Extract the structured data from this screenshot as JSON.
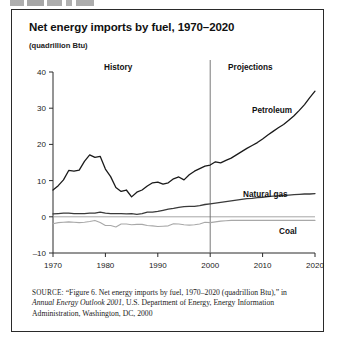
{
  "figure": {
    "top_fragment": "",
    "title": "Net energy imports by fuel, 1970–2020",
    "axis_unit": "(quadrillion Btu)",
    "region_labels": {
      "history": "History",
      "projections": "Projections"
    },
    "series_labels": {
      "petroleum": "Petroleum",
      "natural_gas": "Natural gas",
      "coal": "Coal"
    },
    "source": {
      "prefix": "SOURCE:",
      "part1": " “Figure 6. Net energy imports by fuel, 1970–2020 (quadrillion Btu),” in ",
      "italic": "Annual Energy Outlook 2001",
      "part2": ", U.S. Department of Energy, Energy Information Administration, Washington, DC, 2000"
    }
  },
  "chart_data": {
    "type": "line",
    "title": "Net energy imports by fuel, 1970–2020",
    "xlabel": "",
    "ylabel": "(quadrillion Btu)",
    "xlim": [
      1970,
      2020
    ],
    "ylim": [
      -10,
      40
    ],
    "yticks": [
      -10,
      0,
      10,
      20,
      30,
      40
    ],
    "xticks": [
      1970,
      1980,
      1990,
      2000,
      2010,
      2020
    ],
    "grid": false,
    "legend_position": "inline-right-of-series",
    "annotations": [
      {
        "text": "History",
        "x": 1980,
        "y": 37
      },
      {
        "text": "Projections",
        "x": 2010,
        "y": 37
      },
      {
        "text": "Petroleum",
        "x": 2012,
        "y": 26
      },
      {
        "text": "Natural gas",
        "x": 2011,
        "y": 8
      },
      {
        "text": "Coal",
        "x": 2018,
        "y": -3
      }
    ],
    "history_projection_divider": 2000,
    "x": [
      1970,
      1971,
      1972,
      1973,
      1974,
      1975,
      1976,
      1977,
      1978,
      1979,
      1980,
      1981,
      1982,
      1983,
      1984,
      1985,
      1986,
      1987,
      1988,
      1989,
      1990,
      1991,
      1992,
      1993,
      1994,
      1995,
      1996,
      1997,
      1998,
      1999,
      2000,
      2001,
      2002,
      2003,
      2004,
      2005,
      2006,
      2007,
      2008,
      2009,
      2010,
      2011,
      2012,
      2013,
      2014,
      2015,
      2016,
      2017,
      2018,
      2019,
      2020
    ],
    "series": [
      {
        "name": "Petroleum",
        "color": "#1a1a1a",
        "values": [
          7.4,
          8.6,
          10.2,
          12.8,
          12.6,
          12.9,
          15.3,
          17.1,
          16.4,
          16.7,
          13.2,
          11.1,
          8.1,
          7.0,
          7.4,
          5.5,
          6.8,
          7.4,
          8.5,
          9.4,
          9.6,
          9.0,
          9.4,
          10.5,
          11.0,
          10.2,
          11.6,
          12.6,
          13.3,
          14.0,
          14.3,
          15.2,
          14.9,
          15.6,
          16.2,
          17.1,
          18.0,
          18.9,
          19.7,
          20.5,
          21.5,
          22.6,
          23.6,
          24.6,
          25.5,
          26.7,
          27.9,
          29.4,
          31.0,
          32.9,
          34.7
        ]
      },
      {
        "name": "Natural gas",
        "color": "#3a3a3a",
        "values": [
          0.8,
          0.9,
          1.0,
          1.0,
          0.9,
          0.9,
          0.9,
          1.0,
          1.0,
          1.3,
          1.0,
          0.9,
          0.9,
          0.9,
          0.8,
          0.9,
          0.7,
          0.9,
          1.3,
          1.3,
          1.5,
          1.8,
          2.1,
          2.3,
          2.6,
          2.8,
          2.9,
          2.9,
          3.1,
          3.4,
          3.6,
          3.8,
          4.0,
          4.2,
          4.4,
          4.6,
          4.8,
          5.0,
          5.1,
          5.3,
          5.4,
          5.6,
          5.7,
          5.8,
          5.9,
          6.0,
          6.1,
          6.2,
          6.3,
          6.3,
          6.4
        ]
      },
      {
        "name": "Coal",
        "color": "#a8a8a8",
        "values": [
          -1.9,
          -1.6,
          -1.5,
          -1.4,
          -1.5,
          -1.6,
          -1.5,
          -1.3,
          -1.0,
          -1.6,
          -2.4,
          -2.4,
          -2.8,
          -2.0,
          -2.0,
          -2.2,
          -2.1,
          -2.1,
          -2.4,
          -2.5,
          -2.7,
          -2.6,
          -2.5,
          -1.9,
          -2.0,
          -2.2,
          -2.3,
          -2.2,
          -2.0,
          -1.5,
          -1.6,
          -1.4,
          -1.2,
          -1.1,
          -1.0,
          -1.0,
          -1.0,
          -1.0,
          -1.0,
          -1.0,
          -1.0,
          -1.0,
          -1.0,
          -1.0,
          -1.0,
          -1.0,
          -1.0,
          -1.0,
          -1.0,
          -1.0,
          -1.0
        ]
      }
    ]
  }
}
